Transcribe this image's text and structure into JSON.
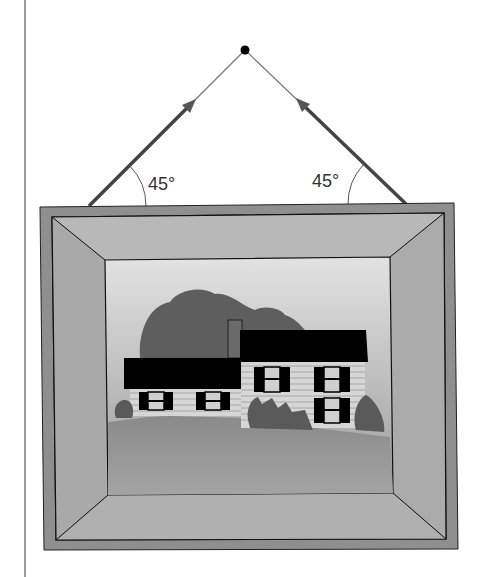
{
  "diagram": {
    "labels": {
      "left_angle": "45°",
      "right_angle": "45°"
    },
    "colors": {
      "frame_outer": "#8c8c8c",
      "frame_inner": "#b0b0b0",
      "sky_top": "#e0e0e0",
      "sky_bottom": "#9a9a9a",
      "ground": "#8a8a8a",
      "tree": "#5a5a5a",
      "roof": "#000000",
      "siding": "#d4d4d4",
      "string": "#444444"
    }
  }
}
